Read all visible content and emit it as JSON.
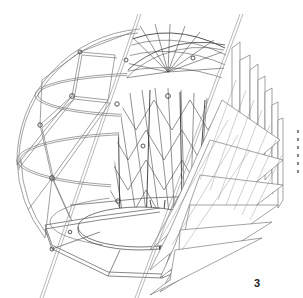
{
  "figure": {
    "label": "3",
    "colors": {
      "line": "#6b6b6b",
      "line_dark": "#3a3a3a",
      "background": "#ffffff",
      "label": "#222222"
    },
    "parts": [
      "geodesic-frame",
      "inner-lattice-dome",
      "shingle-panels",
      "floor-disc",
      "base-ring",
      "section-lines",
      "node-connectors"
    ]
  }
}
